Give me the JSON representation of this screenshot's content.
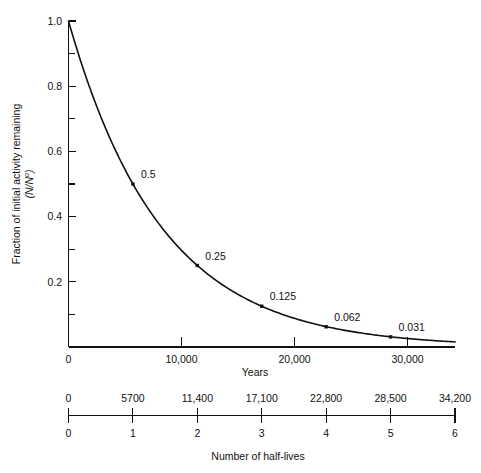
{
  "chart_data": {
    "type": "line",
    "title": "",
    "subtitle": "",
    "xlabel": "Years",
    "ylabel": "Fraction of initial activity remaining",
    "ylabel_sub": "(N/N",
    "ylabel_sub_sup": "o",
    "ylabel_sub_close": ")",
    "xlabel_secondary": "Number of half-lives",
    "xlim": [
      0,
      34200
    ],
    "ylim": [
      0,
      1.0
    ],
    "grid": false,
    "legend": "none",
    "half_life_years": 5700,
    "x_ticks_major": [
      0,
      10000,
      20000,
      30000
    ],
    "x_tick_labels": [
      "0",
      "10,000",
      "20,000",
      "30,000"
    ],
    "y_ticks_major": [
      0,
      0.2,
      0.4,
      0.6,
      0.8,
      1.0
    ],
    "y_tick_labels": [
      "0",
      "0.2",
      "0.4",
      "0.6",
      "0.8",
      "1.0"
    ],
    "y_ticks_minor": [
      0.1,
      0.3,
      0.5,
      0.7,
      0.9
    ],
    "secondary_axis": {
      "top_labels": [
        "0",
        "5700",
        "11,400",
        "17,100",
        "22,800",
        "28,500",
        "34,200"
      ],
      "bottom_labels": [
        "0",
        "1",
        "2",
        "3",
        "4",
        "5",
        "6"
      ],
      "units_top": "years",
      "units_bottom": "half-lives"
    },
    "x": [
      0,
      5700,
      11400,
      17100,
      22800,
      28500,
      34200
    ],
    "y": [
      1.0,
      0.5,
      0.25,
      0.125,
      0.062,
      0.031,
      0.0156
    ],
    "annotations": [
      {
        "x": 5700,
        "y": 0.5,
        "label": "0.5"
      },
      {
        "x": 11400,
        "y": 0.25,
        "label": "0.25"
      },
      {
        "x": 17100,
        "y": 0.125,
        "label": "0.125"
      },
      {
        "x": 22800,
        "y": 0.062,
        "label": "0.062"
      },
      {
        "x": 28500,
        "y": 0.031,
        "label": "0.031"
      }
    ],
    "series": [
      {
        "name": "fraction remaining",
        "values": [
          1.0,
          0.5,
          0.25,
          0.125,
          0.062,
          0.031,
          0.0156
        ]
      }
    ],
    "colors": {
      "curve": "#111111",
      "axis": "#111111",
      "text": "#111111",
      "background": "#ffffff"
    }
  }
}
